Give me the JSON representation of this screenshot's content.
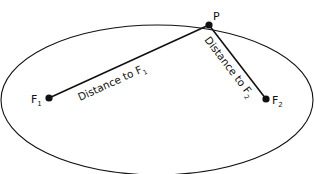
{
  "diagram": {
    "colors": {
      "stroke": "#111111",
      "background": "#ffffff"
    },
    "ellipse": {
      "cx": 157,
      "cy": 108,
      "rx": 156,
      "ry": 88
    },
    "points": {
      "P": {
        "label": "P",
        "x": 209,
        "y": 25
      },
      "F1": {
        "label": "F",
        "subscript": "1",
        "x": 49,
        "y": 98
      },
      "F2": {
        "label": "F",
        "subscript": "2",
        "x": 266,
        "y": 99
      }
    },
    "segments": {
      "to_f1": {
        "label": "Distance to F",
        "subscript": "1"
      },
      "to_f2": {
        "label": "Distance to F",
        "subscript": "2"
      }
    }
  }
}
